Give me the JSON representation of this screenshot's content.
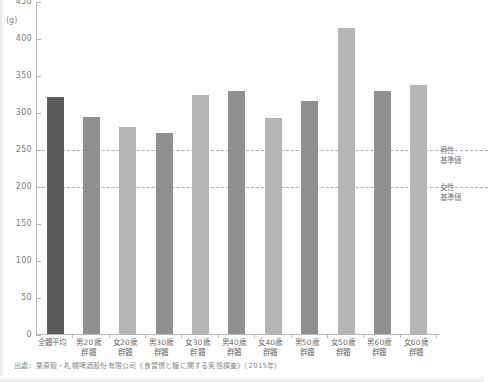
{
  "chart_data": {
    "type": "bar",
    "title": "",
    "subtitle": "",
    "xlabel": "",
    "ylabel": "",
    "unit_label": "(g)",
    "ylim": [
      0,
      450
    ],
    "ytick_values": [
      0,
      50,
      100,
      150,
      200,
      250,
      300,
      350,
      400,
      450
    ],
    "ytick_labels": [
      "0",
      "50",
      "100",
      "150",
      "200",
      "250",
      "300",
      "350",
      "400",
      "450"
    ],
    "grid": false,
    "legend": "none",
    "categories": [
      "全體平均",
      "男20歲群體",
      "女20歲群體",
      "男30歲群體",
      "女30歲群體",
      "男40歲群體",
      "女40歲群體",
      "男50歲群體",
      "女50歲群體",
      "男60歲群體",
      "女60歲群體"
    ],
    "category_lines": [
      [
        "全體平均",
        ""
      ],
      [
        "男20歲",
        "群體"
      ],
      [
        "女20歲",
        "群體"
      ],
      [
        "男30歲",
        "群體"
      ],
      [
        "女30歲",
        "群體"
      ],
      [
        "男40歲",
        "群體"
      ],
      [
        "女40歲",
        "群體"
      ],
      [
        "男50歲",
        "群體"
      ],
      [
        "女50歲",
        "群體"
      ],
      [
        "男60歲",
        "群體"
      ],
      [
        "女60歲",
        "群體"
      ]
    ],
    "values": [
      320,
      293,
      280,
      272,
      323,
      328,
      292,
      315,
      413,
      329,
      336
    ],
    "bar_kinds": [
      "avg",
      "male",
      "female",
      "male",
      "female",
      "male",
      "female",
      "male",
      "female",
      "male",
      "female"
    ],
    "colors": {
      "avg": "#5c5c5c",
      "male": "#8f8f8f",
      "female": "#b5b5b5",
      "axis": "#b9b9b9",
      "text": "#707070",
      "refline": "#b0b0b0"
    },
    "reference_lines": [
      {
        "value": 250,
        "label_line1": "男性",
        "label_line2": "基準値"
      },
      {
        "value": 200,
        "label_line1": "女性",
        "label_line2": "基準値"
      }
    ]
  },
  "source": {
    "text": "出處：栗原毅・札幌啤酒股份有限公司《食習慣と糖に関する実態調査》（2015年）"
  }
}
